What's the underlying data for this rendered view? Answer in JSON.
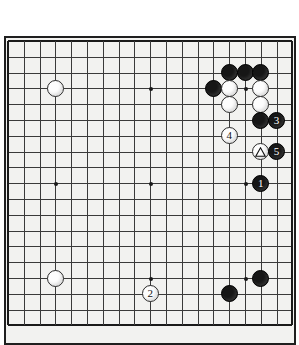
{
  "app": {
    "type": "go-board-diagram",
    "background_color": "#ffffff",
    "board_color": "#f2f2f0",
    "line_color": "#3a3a3a",
    "black_stone_color": "#161616",
    "white_stone_color": "#fdfdfd"
  },
  "board": {
    "size": 19,
    "left": 8,
    "top": 41,
    "spacing": 15.8,
    "star_points": [
      {
        "col": 4,
        "row": 4
      },
      {
        "col": 10,
        "row": 4
      },
      {
        "col": 16,
        "row": 4
      },
      {
        "col": 4,
        "row": 10
      },
      {
        "col": 10,
        "row": 10
      },
      {
        "col": 16,
        "row": 10
      },
      {
        "col": 4,
        "row": 16
      },
      {
        "col": 10,
        "row": 16
      },
      {
        "col": 16,
        "row": 16
      }
    ]
  },
  "stones": [
    {
      "id": "w-a",
      "color": "white",
      "col": 4,
      "row": 4,
      "label": "",
      "marker": ""
    },
    {
      "id": "w-b",
      "color": "white",
      "col": 4,
      "row": 16,
      "label": "",
      "marker": ""
    },
    {
      "id": "b-t1",
      "color": "black",
      "col": 15,
      "row": 3,
      "label": "",
      "marker": ""
    },
    {
      "id": "b-t2",
      "color": "black",
      "col": 16,
      "row": 3,
      "label": "",
      "marker": ""
    },
    {
      "id": "b-t3",
      "color": "black",
      "col": 17,
      "row": 3,
      "label": "",
      "marker": ""
    },
    {
      "id": "b-t4",
      "color": "black",
      "col": 14,
      "row": 4,
      "label": "",
      "marker": ""
    },
    {
      "id": "w-t1",
      "color": "white",
      "col": 15,
      "row": 4,
      "label": "",
      "marker": ""
    },
    {
      "id": "w-t2",
      "color": "white",
      "col": 17,
      "row": 4,
      "label": "",
      "marker": ""
    },
    {
      "id": "w-t3",
      "color": "white",
      "col": 15,
      "row": 5,
      "label": "",
      "marker": ""
    },
    {
      "id": "w-t4",
      "color": "white",
      "col": 17,
      "row": 5,
      "label": "",
      "marker": ""
    },
    {
      "id": "b-t5",
      "color": "black",
      "col": 17,
      "row": 6,
      "label": "",
      "marker": ""
    },
    {
      "id": "move-3",
      "color": "black",
      "col": 18,
      "row": 6,
      "label": "3",
      "marker": ""
    },
    {
      "id": "move-4",
      "color": "white",
      "col": 15,
      "row": 7,
      "label": "4",
      "marker": ""
    },
    {
      "id": "w-tri",
      "color": "white",
      "col": 17,
      "row": 8,
      "label": "",
      "marker": "triangle"
    },
    {
      "id": "move-5",
      "color": "black",
      "col": 18,
      "row": 8,
      "label": "5",
      "marker": ""
    },
    {
      "id": "move-1",
      "color": "black",
      "col": 17,
      "row": 10,
      "label": "1",
      "marker": ""
    },
    {
      "id": "b-b1",
      "color": "black",
      "col": 17,
      "row": 16,
      "label": "",
      "marker": ""
    },
    {
      "id": "b-b2",
      "color": "black",
      "col": 15,
      "row": 17,
      "label": "",
      "marker": ""
    },
    {
      "id": "move-2",
      "color": "white",
      "col": 10,
      "row": 17,
      "label": "2",
      "marker": ""
    }
  ],
  "move_numbers": {
    "one": "1",
    "two": "2",
    "three": "3",
    "four": "4",
    "five": "5"
  },
  "markers": {
    "triangle": "triangle-marker"
  }
}
